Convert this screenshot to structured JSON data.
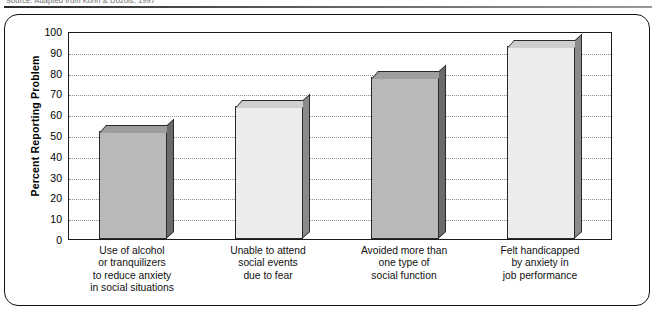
{
  "source_note": "Source: Adapted from Kohn & Dozois, 1997",
  "chart_data": {
    "type": "bar",
    "title": "",
    "xlabel": "",
    "ylabel": "Percent Reporting Problem",
    "ylim": [
      0,
      100
    ],
    "ytick_step": 10,
    "yticks": [
      "100",
      "90",
      "80",
      "70",
      "60",
      "50",
      "40",
      "30",
      "20",
      "10",
      "0"
    ],
    "grid": true,
    "legend": "none",
    "categories": [
      "Use of alcohol\nor tranquilizers\nto reduce anxiety\nin social situations",
      "Unable to attend\nsocial events\ndue to fear",
      "Avoided more than\none type of\nsocial function",
      "Felt handicapped\nby anxiety in\njob performance"
    ],
    "values": [
      52,
      64,
      78,
      93
    ],
    "bar_colors": [
      "#b9b9b9",
      "#ececec",
      "#b9b9b9",
      "#ececec"
    ]
  },
  "categories_lines": [
    [
      "Use of alcohol",
      "or tranquilizers",
      "to reduce anxiety",
      "in social situations"
    ],
    [
      "Unable to attend",
      "social events",
      "due to fear"
    ],
    [
      "Avoided more than",
      "one type of",
      "social function"
    ],
    [
      "Felt handicapped",
      "by anxiety in",
      "job performance"
    ]
  ],
  "colors": {
    "frame_border": "#111111",
    "axis": "#1a1a1a",
    "gridline": "#8e8e8e",
    "bar_dark": "#b9b9b9",
    "bar_light": "#ececec",
    "bar_edge": "#2a2a2a",
    "background": "#ffffff"
  }
}
